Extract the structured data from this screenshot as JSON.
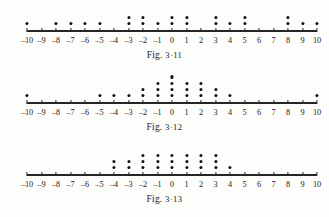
{
  "page": {
    "background_color": "#fdfdfb",
    "ink_color": "#111111"
  },
  "axis": {
    "tick_labels": [
      "-10",
      "-9",
      "-8",
      "-7",
      "-6",
      "-5",
      "-4",
      "-3",
      "-2",
      "-1",
      "0",
      "1",
      "2",
      "3",
      "4",
      "5",
      "6",
      "7",
      "8",
      "9",
      "10"
    ],
    "min": -10,
    "max": 10
  },
  "figures": [
    {
      "id": "fig-3-11",
      "caption_prefix": "Fig.",
      "caption_number": "3·11",
      "chart_data": {
        "type": "scatter",
        "title": "Fig. 3·11",
        "xlabel": "",
        "ylabel": "",
        "xlim": [
          -10,
          10
        ],
        "grid": false,
        "legend": "none",
        "categories": [
          -10,
          -9,
          -8,
          -7,
          -6,
          -5,
          -4,
          -3,
          -2,
          -1,
          0,
          1,
          2,
          3,
          4,
          5,
          6,
          7,
          8,
          9,
          10
        ],
        "values": [
          1,
          0,
          1,
          1,
          1,
          1,
          0,
          2,
          2,
          1,
          2,
          2,
          0,
          2,
          1,
          2,
          0,
          0,
          2,
          1,
          1
        ]
      }
    },
    {
      "id": "fig-3-12",
      "caption_prefix": "Fig.",
      "caption_number": "3·12",
      "chart_data": {
        "type": "scatter",
        "title": "Fig. 3·12",
        "xlabel": "",
        "ylabel": "",
        "xlim": [
          -10,
          10
        ],
        "grid": false,
        "legend": "none",
        "categories": [
          -10,
          -9,
          -8,
          -7,
          -6,
          -5,
          -4,
          -3,
          -2,
          -1,
          0,
          1,
          2,
          3,
          4,
          5,
          6,
          7,
          8,
          9,
          10
        ],
        "values": [
          1,
          0,
          0,
          0,
          0,
          1,
          1,
          1,
          2,
          3,
          4,
          3,
          3,
          2,
          1,
          0,
          0,
          0,
          0,
          0,
          1
        ]
      }
    },
    {
      "id": "fig-3-13",
      "caption_prefix": "Fig.",
      "caption_number": "3·13",
      "chart_data": {
        "type": "scatter",
        "title": "Fig. 3·13",
        "xlabel": "",
        "ylabel": "",
        "xlim": [
          -10,
          10
        ],
        "grid": false,
        "legend": "none",
        "categories": [
          -10,
          -9,
          -8,
          -7,
          -6,
          -5,
          -4,
          -3,
          -2,
          -1,
          0,
          1,
          2,
          3,
          4,
          5,
          6,
          7,
          8,
          9,
          10
        ],
        "values": [
          0,
          0,
          0,
          0,
          0,
          0,
          2,
          2,
          3,
          3,
          3,
          3,
          3,
          3,
          1,
          0,
          0,
          0,
          0,
          0,
          0
        ]
      }
    }
  ]
}
